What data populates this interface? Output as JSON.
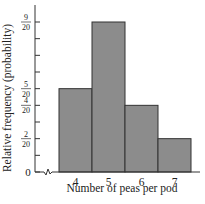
{
  "chart_data": {
    "type": "bar",
    "title": "",
    "xlabel": "Number of peas per pod",
    "ylabel": "Relative frequency (probability)",
    "categories": [
      "4",
      "5",
      "6",
      "7"
    ],
    "values": [
      0.25,
      0.45,
      0.2,
      0.1
    ],
    "value_fractions": [
      "5/20",
      "9/20",
      "4/20",
      "2/20"
    ],
    "ylim": [
      0,
      0.5
    ],
    "y_ticks": [
      {
        "value": 0,
        "label": "0"
      },
      {
        "value": 0.05,
        "label": ""
      },
      {
        "value": 0.1,
        "label": "2/20"
      },
      {
        "value": 0.15,
        "label": ""
      },
      {
        "value": 0.2,
        "label": "4/20"
      },
      {
        "value": 0.25,
        "label": "5/20"
      },
      {
        "value": 0.3,
        "label": ""
      },
      {
        "value": 0.35,
        "label": ""
      },
      {
        "value": 0.4,
        "label": ""
      },
      {
        "value": 0.45,
        "label": "9/20"
      }
    ],
    "x_axis_break": true,
    "grid": false,
    "bar_color": "#8c8c8c",
    "edge_color": "#333333"
  }
}
